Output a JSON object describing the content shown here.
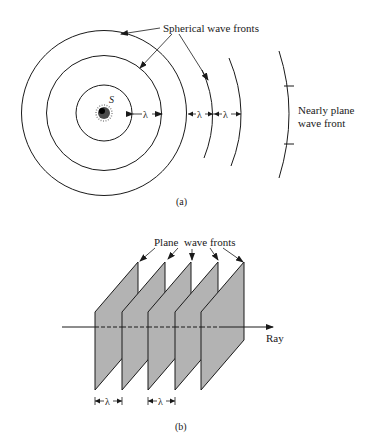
{
  "panel_a": {
    "caption": "(a)",
    "source_label": "S",
    "pointer_label": "Spherical wave fronts",
    "nearly_plane_label_line1": "Nearly plane",
    "nearly_plane_label_line2": "wave front",
    "wavelength_symbol": "λ",
    "wavelength_markers": [
      "λ",
      "λ",
      "λ"
    ]
  },
  "panel_b": {
    "caption": "(b)",
    "pointer_label": "Plane  wave fronts",
    "ray_label": "Ray",
    "plane_count": 5,
    "wavelength_markers": [
      "λ",
      "λ"
    ]
  },
  "colors": {
    "ink": "#1a1a1a",
    "plane_fill": "#b3b3b3",
    "background": "#ffffff"
  }
}
